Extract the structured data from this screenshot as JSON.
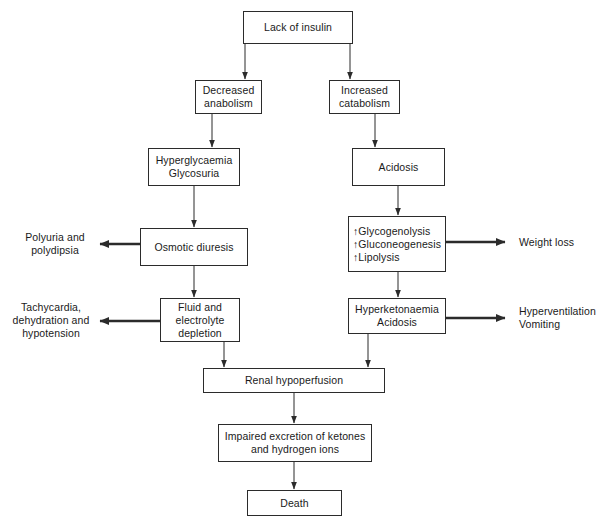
{
  "diagram": {
    "line_color": "#2b2b2b",
    "text_color": "#1a1a1a",
    "background": "#ffffff"
  },
  "nodes": {
    "lack_of_insulin": {
      "text": "Lack of insulin"
    },
    "decreased_anabolism": {
      "line1": "Decreased",
      "line2": "anabolism"
    },
    "increased_catabolism": {
      "line1": "Increased",
      "line2": "catabolism"
    },
    "hyperglycaemia": {
      "line1": "Hyperglycaemia",
      "line2": "Glycosuria"
    },
    "acidosis": {
      "text": "Acidosis"
    },
    "osmotic_diuresis": {
      "text": "Osmotic diuresis"
    },
    "metabolic_increases": {
      "line1": "↑Glycogenolysis",
      "line2": "↑Gluconeogenesis",
      "line3": "↑Lipolysis"
    },
    "fluid_depletion": {
      "line1": "Fluid and",
      "line2": "electrolyte",
      "line3": "depletion"
    },
    "hyperketonaemia": {
      "line1": "Hyperketonaemia",
      "line2": "Acidosis"
    },
    "renal_hypoperfusion": {
      "text": "Renal hypoperfusion"
    },
    "impaired_excretion": {
      "line1": "Impaired excretion of ketones",
      "line2": "and hydrogen ions"
    },
    "death": {
      "text": "Death"
    }
  },
  "labels": {
    "polyuria": {
      "line1": "Polyuria and",
      "line2": "polydipsia"
    },
    "weight_loss": {
      "text": "Weight loss"
    },
    "tachycardia": {
      "line1": "Tachycardia,",
      "line2": "dehydration and",
      "line3": "hypotension"
    },
    "hyperventilation": {
      "line1": "Hyperventilation",
      "line2": "Vomiting"
    }
  }
}
